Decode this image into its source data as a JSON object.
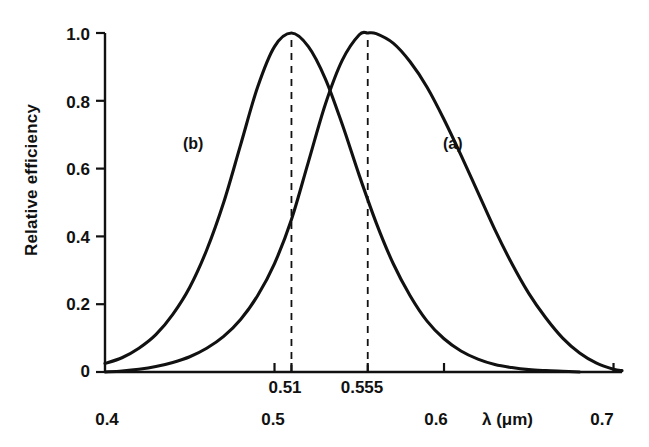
{
  "chart_data": {
    "type": "line",
    "title": "",
    "xlabel": "λ (μm)",
    "ylabel": "Relative efficiency",
    "xlim": [
      0.4,
      0.705
    ],
    "ylim": [
      0.0,
      1.0
    ],
    "grid": false,
    "legend": "inline-curve-labels",
    "x_ticks": [
      {
        "value": 0.4,
        "label": "0.4",
        "row": 2,
        "tick_mark": false
      },
      {
        "value": 0.5,
        "label": "0.5",
        "row": 2,
        "tick_mark": true
      },
      {
        "value": 0.51,
        "label": "0.51",
        "row": 1,
        "tick_mark": true
      },
      {
        "value": 0.555,
        "label": "0.555",
        "row": 1,
        "tick_mark": true
      },
      {
        "value": 0.6,
        "label": "0.6",
        "row": 2,
        "tick_mark": true
      },
      {
        "value": 0.7,
        "label": "0.7",
        "row": 2,
        "tick_mark": true
      }
    ],
    "y_ticks": [
      {
        "value": 0.0,
        "label": "0"
      },
      {
        "value": 0.2,
        "label": "0.2"
      },
      {
        "value": 0.4,
        "label": "0.4"
      },
      {
        "value": 0.6,
        "label": "0.6"
      },
      {
        "value": 0.8,
        "label": "0.8"
      },
      {
        "value": 1.0,
        "label": "1.0"
      }
    ],
    "annotations": [
      {
        "text": "(a)",
        "x": 0.655,
        "y": 0.665,
        "refers_to": "photopic-curve"
      },
      {
        "text": "(b)",
        "x": 0.452,
        "y": 0.665,
        "refers_to": "scotopic-curve"
      }
    ],
    "reference_lines": [
      {
        "type": "vertical-dashed",
        "x": 0.51,
        "from_y": 0.0,
        "to_y": 1.0,
        "label": "0.51"
      },
      {
        "type": "vertical-dashed",
        "x": 0.555,
        "from_y": 0.0,
        "to_y": 1.0,
        "label": "0.555"
      }
    ],
    "crossover": {
      "x": 0.5255,
      "y": 0.855
    },
    "series": [
      {
        "name": "(a)",
        "peak_x": 0.555,
        "peak_y": 1.0,
        "color": "#111111",
        "x": [
          0.4,
          0.41,
          0.42,
          0.43,
          0.44,
          0.45,
          0.46,
          0.47,
          0.48,
          0.49,
          0.5,
          0.51,
          0.52,
          0.53,
          0.54,
          0.55,
          0.555,
          0.56,
          0.57,
          0.58,
          0.59,
          0.6,
          0.61,
          0.62,
          0.63,
          0.64,
          0.65,
          0.66,
          0.67,
          0.68,
          0.69,
          0.7,
          0.705
        ],
        "y": [
          0.0,
          0.003,
          0.008,
          0.016,
          0.028,
          0.045,
          0.07,
          0.105,
          0.155,
          0.225,
          0.32,
          0.45,
          0.62,
          0.79,
          0.92,
          0.995,
          1.0,
          0.998,
          0.97,
          0.915,
          0.84,
          0.745,
          0.64,
          0.53,
          0.42,
          0.32,
          0.232,
          0.16,
          0.1,
          0.056,
          0.026,
          0.008,
          0.004
        ]
      },
      {
        "name": "(b)",
        "peak_x": 0.51,
        "peak_y": 1.0,
        "color": "#111111",
        "x": [
          0.4,
          0.41,
          0.42,
          0.43,
          0.44,
          0.45,
          0.46,
          0.47,
          0.48,
          0.49,
          0.5,
          0.51,
          0.52,
          0.53,
          0.54,
          0.55,
          0.56,
          0.57,
          0.58,
          0.59,
          0.6,
          0.61,
          0.62,
          0.63,
          0.64,
          0.65,
          0.66,
          0.67,
          0.68
        ],
        "y": [
          0.025,
          0.042,
          0.07,
          0.11,
          0.17,
          0.25,
          0.36,
          0.5,
          0.67,
          0.84,
          0.96,
          1.0,
          0.96,
          0.865,
          0.73,
          0.58,
          0.44,
          0.32,
          0.225,
          0.15,
          0.098,
          0.062,
          0.038,
          0.022,
          0.013,
          0.007,
          0.004,
          0.002,
          0.0
        ]
      }
    ]
  },
  "axes": {
    "y_axis_title": "Relative efficiency",
    "x_axis_title": "λ (μm)"
  }
}
